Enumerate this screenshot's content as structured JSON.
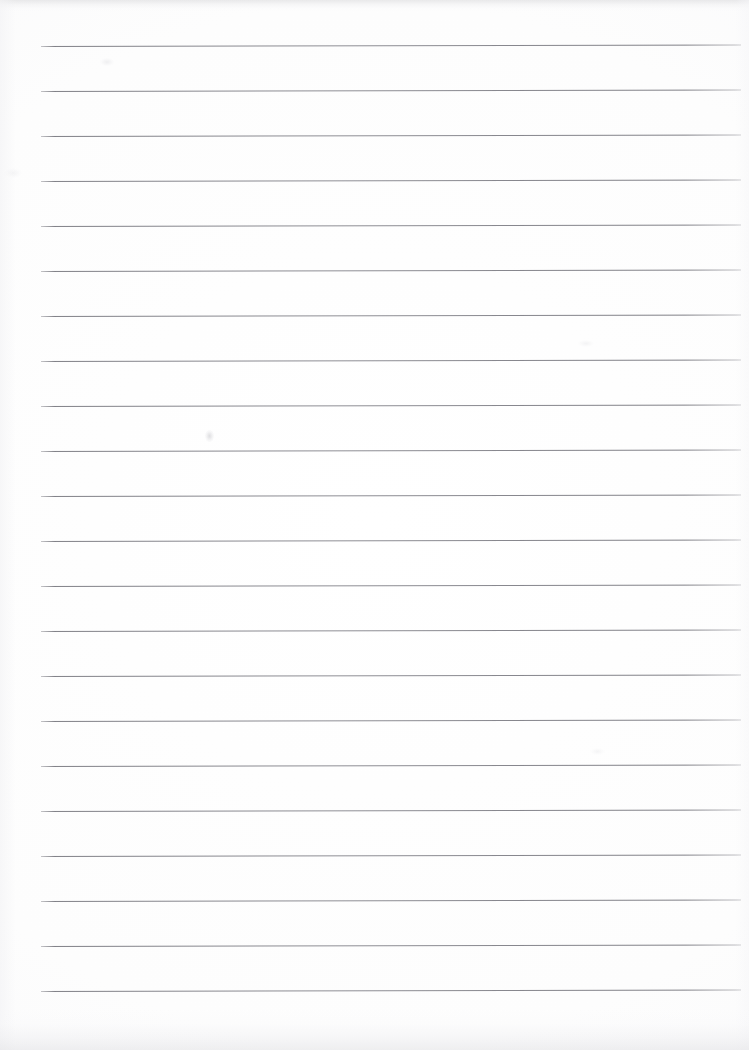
{
  "document": {
    "kind": "scanned-lined-paper",
    "title": "Blank Lined Paper",
    "page_width": 749,
    "page_height": 1050,
    "paper_color": "#ffffff",
    "rule_color": "#808087",
    "orientation": "portrait",
    "visible_text": "",
    "handwriting": "none",
    "margin_line": "none",
    "header_text": "",
    "footer_text": "",
    "page_number": ""
  },
  "ruling": {
    "line_count": 22,
    "line_spacing_px": 45,
    "first_line_y": 46,
    "last_line_y": 991,
    "line_start_x": 41,
    "line_end_x": 741,
    "line_length_px": 700,
    "line_thickness_px": 1,
    "tilt_deg": -0.13,
    "lines": [
      {
        "index": 1,
        "y": 46,
        "x1": 41,
        "x2": 741
      },
      {
        "index": 2,
        "y": 91,
        "x1": 41,
        "x2": 741
      },
      {
        "index": 3,
        "y": 136,
        "x1": 41,
        "x2": 741
      },
      {
        "index": 4,
        "y": 181,
        "x1": 41,
        "x2": 741
      },
      {
        "index": 5,
        "y": 226,
        "x1": 41,
        "x2": 741
      },
      {
        "index": 6,
        "y": 271,
        "x1": 41,
        "x2": 741
      },
      {
        "index": 7,
        "y": 316,
        "x1": 41,
        "x2": 741
      },
      {
        "index": 8,
        "y": 361,
        "x1": 41,
        "x2": 741
      },
      {
        "index": 9,
        "y": 406,
        "x1": 41,
        "x2": 741
      },
      {
        "index": 10,
        "y": 451,
        "x1": 41,
        "x2": 741
      },
      {
        "index": 11,
        "y": 496,
        "x1": 41,
        "x2": 741
      },
      {
        "index": 12,
        "y": 541,
        "x1": 41,
        "x2": 741
      },
      {
        "index": 13,
        "y": 586,
        "x1": 41,
        "x2": 741
      },
      {
        "index": 14,
        "y": 631,
        "x1": 41,
        "x2": 741
      },
      {
        "index": 15,
        "y": 676,
        "x1": 41,
        "x2": 741
      },
      {
        "index": 16,
        "y": 721,
        "x1": 41,
        "x2": 741
      },
      {
        "index": 17,
        "y": 766,
        "x1": 41,
        "x2": 741
      },
      {
        "index": 18,
        "y": 811,
        "x1": 41,
        "x2": 741
      },
      {
        "index": 19,
        "y": 856,
        "x1": 41,
        "x2": 741
      },
      {
        "index": 20,
        "y": 901,
        "x1": 41,
        "x2": 741
      },
      {
        "index": 21,
        "y": 946,
        "x1": 41,
        "x2": 741
      },
      {
        "index": 22,
        "y": 991,
        "x1": 41,
        "x2": 741
      }
    ]
  },
  "artifacts": {
    "top_band": {
      "height_px": 12,
      "color": "#cdcdd0"
    },
    "bottom_band": {
      "height_px": 42,
      "color": "#e2e2e5"
    },
    "smudges": [
      {
        "name": "smudge-a",
        "x": 205,
        "y": 430
      },
      {
        "name": "smudge-b",
        "x": 100,
        "y": 58
      },
      {
        "name": "smudge-c",
        "x": 578,
        "y": 340
      },
      {
        "name": "smudge-d",
        "x": 590,
        "y": 748
      },
      {
        "name": "smudge-e",
        "x": 4,
        "y": 168
      }
    ]
  }
}
